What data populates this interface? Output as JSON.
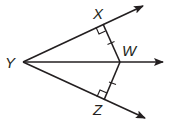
{
  "diagram": {
    "type": "geometry-angle-bisector",
    "color": "#231f20",
    "points": {
      "Y": {
        "label": "Y",
        "x": 23,
        "y": 62
      },
      "X": {
        "label": "X",
        "x": 103,
        "y": 24
      },
      "W": {
        "label": "W",
        "x": 120,
        "y": 62
      },
      "Z": {
        "label": "Z",
        "x": 104,
        "y": 100
      }
    },
    "rays": [
      {
        "name": "ray-YX",
        "from": "Y",
        "through": "X"
      },
      {
        "name": "ray-YW",
        "from": "Y",
        "through": "W"
      },
      {
        "name": "ray-YZ",
        "from": "Y",
        "through": "Z"
      }
    ],
    "segments": [
      {
        "name": "segment-XW",
        "from": "X",
        "to": "W",
        "tick_marks": 1
      },
      {
        "name": "segment-ZW",
        "from": "Z",
        "to": "W",
        "tick_marks": 1
      }
    ],
    "right_angles": [
      "X",
      "Z"
    ],
    "labels": {
      "X": "X",
      "W": "W",
      "Y": "Y",
      "Z": "Z"
    }
  }
}
